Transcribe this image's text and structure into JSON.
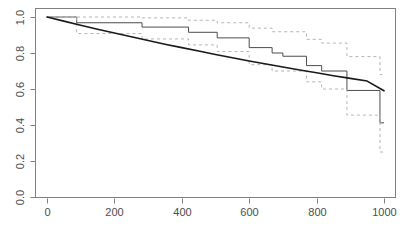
{
  "chart_data": {
    "type": "line",
    "title": "",
    "subtitle": "",
    "xlabel": "",
    "ylabel": "",
    "xlim": [
      -60,
      1040
    ],
    "ylim": [
      0.0,
      1.04
    ],
    "grid": false,
    "legend": null,
    "xticks": [
      0,
      200,
      400,
      600,
      800,
      1000
    ],
    "xtick_labels": [
      "0",
      "200",
      "400",
      "600",
      "800",
      "1000"
    ],
    "yticks": [
      0.0,
      0.2,
      0.4,
      0.6,
      0.8,
      1.0
    ],
    "ytick_labels": [
      "0.0",
      "0.2",
      "0.4",
      "0.6",
      "0.8",
      "1.0"
    ],
    "series": [
      {
        "name": "Kaplan-Meier step estimate",
        "style": "step",
        "color": "#4d4d4d",
        "x": [
          0,
          88,
          88,
          282,
          282,
          420,
          420,
          505,
          505,
          600,
          600,
          668,
          668,
          700,
          700,
          770,
          770,
          815,
          815,
          890,
          890,
          988,
          988,
          1000
        ],
        "y": [
          1.0,
          1.0,
          0.968,
          0.968,
          0.944,
          0.944,
          0.915,
          0.915,
          0.884,
          0.884,
          0.83,
          0.83,
          0.8,
          0.8,
          0.782,
          0.782,
          0.73,
          0.73,
          0.7,
          0.7,
          0.592,
          0.592,
          0.412,
          0.412
        ]
      },
      {
        "name": "Upper 95% confidence band",
        "style": "step-dashed",
        "color": "#b5b5b5",
        "x": [
          0,
          88,
          88,
          282,
          282,
          420,
          420,
          505,
          505,
          600,
          600,
          668,
          668,
          770,
          770,
          815,
          815,
          890,
          890,
          988,
          988,
          1000
        ],
        "y": [
          1.0,
          1.0,
          1.0,
          1.0,
          0.995,
          0.995,
          0.982,
          0.982,
          0.968,
          0.968,
          0.938,
          0.938,
          0.918,
          0.918,
          0.876,
          0.876,
          0.855,
          0.855,
          0.78,
          0.78,
          0.68,
          0.68
        ]
      },
      {
        "name": "Lower 95% confidence band",
        "style": "step-dashed",
        "color": "#b5b5b5",
        "x": [
          0,
          88,
          88,
          282,
          282,
          420,
          420,
          505,
          505,
          600,
          600,
          668,
          668,
          770,
          770,
          815,
          815,
          890,
          890,
          988,
          988,
          1000
        ],
        "y": [
          1.0,
          1.0,
          0.908,
          0.908,
          0.878,
          0.878,
          0.845,
          0.845,
          0.808,
          0.808,
          0.735,
          0.735,
          0.7,
          0.7,
          0.64,
          0.64,
          0.6,
          0.6,
          0.455,
          0.455,
          0.25,
          0.25
        ]
      },
      {
        "name": "Fitted parametric survival curve",
        "style": "smooth",
        "color": "#1a1a1a",
        "x": [
          0,
          50,
          100,
          150,
          200,
          250,
          300,
          350,
          400,
          450,
          500,
          550,
          600,
          650,
          700,
          750,
          800,
          850,
          900,
          950,
          1000
        ],
        "y": [
          1.0,
          0.977,
          0.954,
          0.932,
          0.911,
          0.89,
          0.869,
          0.849,
          0.83,
          0.811,
          0.792,
          0.774,
          0.756,
          0.739,
          0.722,
          0.706,
          0.69,
          0.674,
          0.659,
          0.644,
          0.59
        ]
      }
    ]
  },
  "geometry": {
    "plot_left": 35,
    "plot_right": 396,
    "plot_top": 8,
    "plot_bottom": 198,
    "x_zero_px": 47,
    "x_1000_px": 384,
    "y_0_px": 197,
    "y_1_px": 17
  }
}
